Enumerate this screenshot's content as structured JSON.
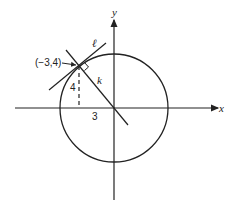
{
  "diagram": {
    "type": "coordinate-geometry",
    "axes": {
      "x_label": "x",
      "y_label": "y"
    },
    "circle": {
      "center": [
        0,
        0
      ],
      "radius": 5
    },
    "point": {
      "label": "(−3,4)",
      "coords": [
        -3,
        4
      ]
    },
    "lines": {
      "tangent": {
        "label": "ℓ"
      },
      "radius_line": {
        "label": "k"
      }
    },
    "segments": {
      "vertical_leg": "4",
      "horizontal_leg": "3"
    },
    "colors": {
      "stroke": "#222222",
      "background": "#ffffff"
    }
  }
}
